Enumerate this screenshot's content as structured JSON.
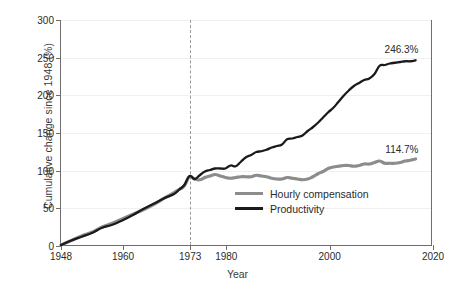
{
  "chart_data": {
    "type": "line",
    "title": "",
    "xlabel": "Year",
    "ylabel": "Cumulative change since 1948 (%)",
    "xlim": [
      1948,
      2020
    ],
    "ylim": [
      0,
      300
    ],
    "grid": true,
    "legend_position": "bottom-right",
    "xticks": [
      1948,
      1960,
      1973,
      1980,
      2000,
      2020
    ],
    "xtick_labels": [
      "1948",
      "1960",
      "1973",
      "1980",
      "2000",
      "2020"
    ],
    "yticks": [
      0,
      50,
      100,
      150,
      200,
      250,
      300
    ],
    "ytick_labels": [
      "0",
      "50",
      "100",
      "150",
      "200",
      "250",
      "300"
    ],
    "annotations": [
      {
        "name": "productivity-endpoint",
        "text": "246.3%",
        "x": 2017,
        "y": 246.3
      },
      {
        "name": "compensation-endpoint",
        "text": "114.7%",
        "x": 2017,
        "y": 114.7
      }
    ],
    "vertical_marker": {
      "x": 1973,
      "label": "1973",
      "style": "dashed"
    },
    "series": [
      {
        "name": "Hourly compensation",
        "color": "#8c8c8c",
        "width": 3.2,
        "x": [
          1948,
          1950,
          1952,
          1954,
          1956,
          1958,
          1960,
          1962,
          1964,
          1966,
          1968,
          1970,
          1971,
          1972,
          1973,
          1974,
          1975,
          1976,
          1977,
          1978,
          1979,
          1980,
          1981,
          1982,
          1983,
          1984,
          1985,
          1986,
          1987,
          1988,
          1989,
          1990,
          1991,
          1992,
          1993,
          1994,
          1995,
          1996,
          1997,
          1998,
          1999,
          2000,
          2001,
          2002,
          2003,
          2004,
          2005,
          2006,
          2007,
          2008,
          2009,
          2010,
          2011,
          2012,
          2013,
          2014,
          2015,
          2016,
          2017
        ],
        "values": [
          0,
          6,
          12,
          17,
          24,
          29,
          35,
          41,
          47,
          54,
          62,
          70,
          74,
          79,
          91,
          88,
          87,
          90,
          92,
          94,
          92,
          90,
          89,
          90,
          91,
          91,
          91,
          93,
          92,
          91,
          89,
          88,
          88,
          90,
          89,
          88,
          87,
          88,
          91,
          95,
          98,
          102,
          104,
          105,
          106,
          106,
          105,
          106,
          108,
          108,
          110,
          112,
          109,
          109,
          109,
          110,
          112,
          113,
          114.7
        ]
      },
      {
        "name": "Productivity",
        "color": "#1a1a1a",
        "width": 2.3,
        "x": [
          1948,
          1950,
          1952,
          1954,
          1956,
          1958,
          1960,
          1962,
          1964,
          1966,
          1968,
          1970,
          1971,
          1972,
          1973,
          1974,
          1975,
          1976,
          1977,
          1978,
          1979,
          1980,
          1981,
          1982,
          1983,
          1984,
          1985,
          1986,
          1987,
          1988,
          1989,
          1990,
          1991,
          1992,
          1993,
          1994,
          1995,
          1996,
          1997,
          1998,
          1999,
          2000,
          2001,
          2002,
          2003,
          2004,
          2005,
          2006,
          2007,
          2008,
          2009,
          2010,
          2011,
          2012,
          2013,
          2014,
          2015,
          2016,
          2017
        ],
        "values": [
          0,
          6,
          11,
          16,
          23,
          27,
          33,
          40,
          48,
          55,
          62,
          68,
          74,
          80,
          92,
          88,
          93,
          98,
          100,
          102,
          102,
          102,
          106,
          105,
          111,
          117,
          120,
          124,
          125,
          127,
          130,
          132,
          134,
          141,
          142,
          144,
          146,
          152,
          157,
          163,
          170,
          177,
          183,
          191,
          199,
          206,
          212,
          216,
          220,
          222,
          228,
          239,
          240,
          242,
          243,
          244,
          245,
          245,
          246.3
        ]
      }
    ]
  }
}
